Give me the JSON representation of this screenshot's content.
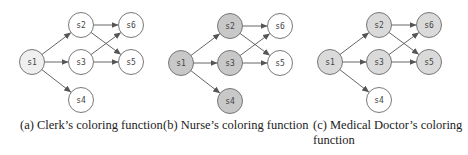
{
  "colors": {
    "edge": "#555555",
    "node_stroke": "#6a6a6a",
    "white": "#ffffff",
    "clerk_fill": "#efefef",
    "nurse_fill": "#c8c8c8",
    "doctor_fill": "#dadada",
    "label": "#444444"
  },
  "graph": {
    "node_radius": 12.5,
    "nodes": [
      {
        "id": "s1",
        "label": "s1",
        "dx": 0,
        "dy": 37
      },
      {
        "id": "s2",
        "label": "s2",
        "dx": 49,
        "dy": 0
      },
      {
        "id": "s3",
        "label": "s3",
        "dx": 49,
        "dy": 37
      },
      {
        "id": "s4",
        "label": "s4",
        "dx": 49,
        "dy": 75
      },
      {
        "id": "s5",
        "label": "s5",
        "dx": 99,
        "dy": 37
      },
      {
        "id": "s6",
        "label": "s6",
        "dx": 99,
        "dy": 0
      }
    ],
    "edges": [
      {
        "from": "s1",
        "to": "s2"
      },
      {
        "from": "s1",
        "to": "s3"
      },
      {
        "from": "s1",
        "to": "s4"
      },
      {
        "from": "s2",
        "to": "s6"
      },
      {
        "from": "s2",
        "to": "s5"
      },
      {
        "from": "s3",
        "to": "s6"
      },
      {
        "from": "s3",
        "to": "s5"
      }
    ]
  },
  "panels": [
    {
      "id": "a",
      "origin": [
        32,
        25
      ],
      "caption": "(a) Clerk’s coloring function",
      "colored_nodes": [
        "s1"
      ],
      "fill_key": "clerk_fill"
    },
    {
      "id": "b",
      "origin": [
        181,
        26
      ],
      "caption": "(b) Nurse’s coloring function",
      "colored_nodes": [
        "s1",
        "s2",
        "s3",
        "s4"
      ],
      "fill_key": "nurse_fill"
    },
    {
      "id": "c",
      "origin": [
        330,
        25
      ],
      "caption": "(c) Medical Doctor’s coloring function",
      "colored_nodes": [
        "s1",
        "s2",
        "s3",
        "s5",
        "s6"
      ],
      "fill_key": "doctor_fill"
    }
  ]
}
